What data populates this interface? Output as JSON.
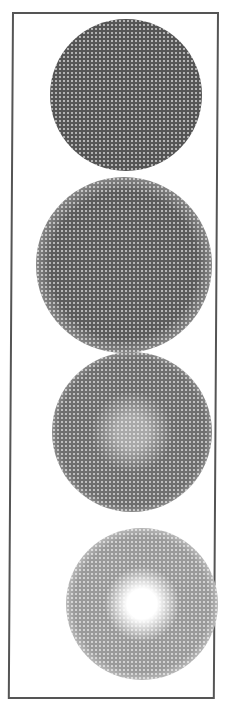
{
  "figure": {
    "frame_color": "#555555",
    "background": "#ffffff",
    "spots": [
      {
        "name": "spot-1",
        "description": "dense dark disc with soft halo",
        "cx": 126,
        "cy": 95,
        "core_radius": 54,
        "halo_radius": 76,
        "core_color": "#555555",
        "halo_color": "#a8a8a8",
        "center_color": "#555555"
      },
      {
        "name": "spot-2",
        "description": "dark disc with wide textured halo",
        "cx": 124,
        "cy": 265,
        "core_radius": 52,
        "halo_radius": 88,
        "core_color": "#5c5c5c",
        "halo_color": "#9e9e9e",
        "center_color": "#5c5c5c"
      },
      {
        "name": "spot-3",
        "description": "medium grey halftone disc with lighter center",
        "cx": 132,
        "cy": 432,
        "core_radius": 52,
        "halo_radius": 80,
        "core_color": "#6f6f6f",
        "halo_color": "#bdbdbd",
        "center_color": "#a9a9a9"
      },
      {
        "name": "spot-4",
        "description": "light halftone ring with bright white center",
        "cx": 142,
        "cy": 604,
        "core_radius": 48,
        "halo_radius": 76,
        "core_color": "#9a9a9a",
        "halo_color": "#dcdcdc",
        "center_color": "#ffffff"
      }
    ]
  }
}
